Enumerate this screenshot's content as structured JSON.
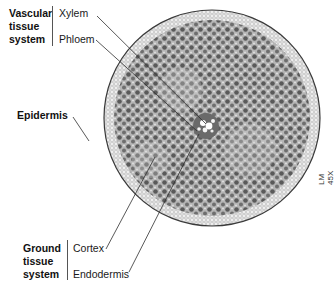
{
  "diagram": {
    "groups": [
      {
        "name": "Vascular tissue system",
        "lines": [
          "Vascular",
          "tissue",
          "system"
        ],
        "members": [
          "Xylem",
          "Phloem"
        ]
      },
      {
        "name": "Ground tissue system",
        "lines": [
          "Ground",
          "tissue",
          "system"
        ],
        "members": [
          "Cortex",
          "Endodermis"
        ]
      }
    ],
    "labels": {
      "xylem": "Xylem",
      "phloem": "Phloem",
      "epidermis": "Epidermis",
      "cortex": "Cortex",
      "endodermis": "Endodermis"
    },
    "vascular_heading": {
      "l1": "Vascular",
      "l2": "tissue",
      "l3": "system"
    },
    "ground_heading": {
      "l1": "Ground",
      "l2": "tissue",
      "l3": "system"
    },
    "magnification": "LM 45X",
    "colors": {
      "outer_ring": "#e6e6e6",
      "cortex_fill": "#a9a9a9",
      "cell_dark": "#555555",
      "leader_line": "#333333"
    }
  }
}
